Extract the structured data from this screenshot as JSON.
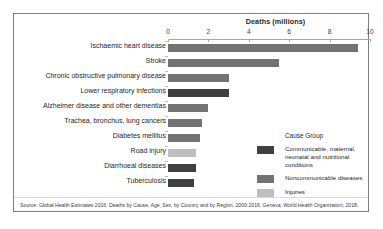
{
  "chart_data": {
    "type": "bar",
    "orientation": "horizontal",
    "title": "",
    "xlabel": "Deaths (millions)",
    "ylabel": "",
    "xlim": [
      0,
      10
    ],
    "xticks": [
      0,
      2,
      4,
      6,
      8,
      10
    ],
    "grid": false,
    "categories": [
      "Ischaemic heart disease",
      "Stroke",
      "Chronic obstructive pulmonary disease",
      "Lower respiratory infections",
      "Alzheimer disease and other dementias",
      "Trachea, bronchus, lung cancers",
      "Diabetes mellitus",
      "Road injury",
      "Diarrhoeal diseases",
      "Tuberculosis"
    ],
    "values": [
      9.4,
      5.5,
      3.0,
      3.0,
      2.0,
      1.7,
      1.6,
      1.4,
      1.4,
      1.3
    ],
    "groups": [
      "Noncommunicable diseases",
      "Noncommunicable diseases",
      "Noncommunicable diseases",
      "Communicable, maternal, neonatal and nutritional conditions",
      "Noncommunicable diseases",
      "Noncommunicable diseases",
      "Noncommunicable diseases",
      "Injuries",
      "Communicable, maternal, neonatal and nutritional conditions",
      "Communicable, maternal, neonatal and nutritional conditions"
    ],
    "legend": {
      "title": "Cause Group",
      "position": "inside-right",
      "entries": [
        {
          "label": "Communicable, maternal, neonatal and nutritional conditions",
          "color": "#404040"
        },
        {
          "label": "Noncommunicable diseases",
          "color": "#737373"
        },
        {
          "label": "Injuries",
          "color": "#bfbfbf"
        }
      ]
    },
    "colors": {
      "communicable": "#404040",
      "noncommunicable": "#737373",
      "injuries": "#bfbfbf",
      "axis": "#a6a6a6",
      "frame": "#7f7f7f",
      "text": "#262626"
    }
  },
  "source": {
    "text": "Source: Global Health Estimates 2016: Deaths by Cause, Age, Sex, by Country and by Region, 2000-2016. Geneva, World Health Organization; 2018."
  }
}
